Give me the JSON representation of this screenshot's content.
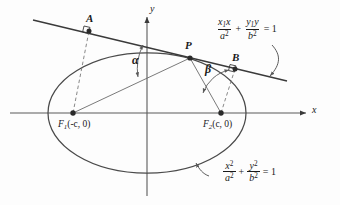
{
  "figure": {
    "axes": {
      "x_label": "x",
      "y_label": "y",
      "origin_label": ""
    },
    "points": [
      {
        "id": "A",
        "label": "A",
        "description": "foot of perpendicular from F1 to tangent line"
      },
      {
        "id": "P",
        "label": "P",
        "description": "point of tangency on ellipse"
      },
      {
        "id": "B",
        "label": "B",
        "description": "foot of perpendicular from F2 to tangent line"
      },
      {
        "id": "F1",
        "label": "F",
        "subscript": "1",
        "coords": "(-c, 0)",
        "full": "F1(-c, 0)"
      },
      {
        "id": "F2",
        "label": "F",
        "subscript": "2",
        "coords": "(c, 0)",
        "full": "F2(c, 0)"
      }
    ],
    "angles": [
      {
        "id": "alpha",
        "label": "α",
        "description": "angle at P between tangent line and line PF1"
      },
      {
        "id": "beta",
        "label": "β",
        "description": "angle at P between line PF2 and tangent line"
      }
    ],
    "equations": {
      "tangent": {
        "num1": "x",
        "num1_sub": "1",
        "num1_tail": "x",
        "den1": "a",
        "den1_exp": "2",
        "plus": "+",
        "num2": "y",
        "num2_sub": "1",
        "num2_tail": "y",
        "den2": "b",
        "den2_exp": "2",
        "equals": "= 1",
        "plain": "x₁x/a² + y₁y/b² = 1"
      },
      "ellipse": {
        "num1": "x",
        "num1_exp": "2",
        "den1": "a",
        "den1_exp": "2",
        "plus": "+",
        "num2": "y",
        "num2_exp": "2",
        "den2": "b",
        "den2_exp": "2",
        "equals": "= 1",
        "plain": "x²/a² + y²/b² = 1"
      }
    },
    "markers": {
      "right_angle_a": "right-angle marker at A",
      "right_angle_b": "right-angle marker at B"
    },
    "colors": {
      "stroke": "#3a3a3a",
      "stroke_light": "#6b6b6b",
      "text": "#1a1a1a",
      "background": "#fdfdfd"
    }
  }
}
